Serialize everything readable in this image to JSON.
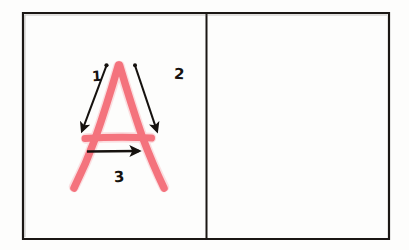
{
  "worksheet": {
    "title": "Letter A stroke order practice",
    "background_color": "#fdfdfc",
    "border_color": "#1b1714",
    "panels": [
      {
        "name": "example-panel",
        "content": "letter-a-with-stroke-order",
        "empty": false
      },
      {
        "name": "practice-panel",
        "content": "",
        "empty": true
      }
    ]
  },
  "letter": {
    "character": "A",
    "ink_color": "#f4626e",
    "style": "hand-drawn-marker"
  },
  "strokes": [
    {
      "number": "1",
      "label": "1",
      "direction": "down-left",
      "description": "left diagonal of A, drawn from apex downward to the left"
    },
    {
      "number": "2",
      "label": "2",
      "direction": "down-right",
      "description": "right diagonal of A, drawn from apex downward to the right"
    },
    {
      "number": "3",
      "label": "3",
      "direction": "right",
      "description": "horizontal crossbar of A, drawn left to right"
    }
  ],
  "arrow_color": "#16120f"
}
